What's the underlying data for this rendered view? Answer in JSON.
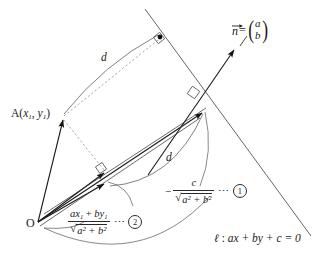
{
  "figure": {
    "type": "geometry-diagram",
    "background": "#ffffff",
    "stroke_color": "#2a2a2a",
    "arc_color": "#6a6a6a",
    "dash_color": "#8a8a8a"
  },
  "labels": {
    "point_a": {
      "name": "A",
      "open_paren": "(",
      "x_var": "x",
      "x_sub": "1",
      "comma": ", ",
      "y_var": "y",
      "y_sub": "1",
      "close_paren": ")"
    },
    "origin": "O",
    "normal_vector": {
      "symbol": "n",
      "equals": "=",
      "component_top": "a",
      "component_bottom": "b"
    },
    "distance_upper": "d",
    "distance_lower": "d",
    "line_equation": {
      "name": "ℓ",
      "colon": " : ",
      "body": "ax + by + c = 0"
    }
  },
  "formulas": {
    "first": {
      "sign": "−",
      "numerator": "c",
      "denominator_radicand": "a² + b²",
      "denominator_prefix": "√",
      "dots": "⋯",
      "tag": "1"
    },
    "second": {
      "sign": "",
      "numerator_parts": {
        "a": "a",
        "x": "x",
        "x_sub": "1",
        "plus": "+",
        "b": "b",
        "y": "y",
        "y_sub": "1"
      },
      "denominator_radicand": "a² + b²",
      "denominator_prefix": "√",
      "dots": "⋯",
      "tag": "2"
    }
  },
  "geometry": {
    "origin_point": [
      38,
      222
    ],
    "point_a": [
      62,
      118
    ],
    "foot_on_line_from_a": [
      160,
      38
    ],
    "projection_point_outer": [
      205,
      110
    ],
    "projection_point_inner": [
      106,
      182
    ],
    "line_l_endpoints": [
      [
        145,
        9
      ],
      [
        311,
        236
      ]
    ],
    "normal_arrow_tip": [
      237,
      47
    ],
    "right_angle_markers": [
      [
        160,
        38
      ],
      [
        193,
        93
      ],
      [
        101,
        168
      ]
    ]
  }
}
